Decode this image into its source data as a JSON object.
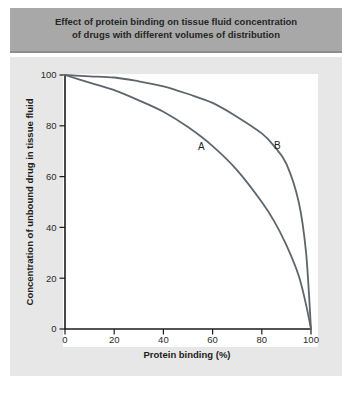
{
  "figure": {
    "title_lines": [
      "Effect of protein binding on tissue fluid concentration",
      "of drugs with different volumes of distribution"
    ]
  },
  "colors": {
    "title_bar_bg": "#a8a8a8",
    "title_bar_edge": "#8d8d8d",
    "title_text": "#262626",
    "panel_bg": "#e7e7e7",
    "plot_bg": "#ffffff",
    "axis": "#1c1c1c",
    "tick_text": "#2a2a2a",
    "curve": "#5d656d"
  },
  "chart_data": {
    "type": "line",
    "title": "Effect of protein binding on tissue fluid concentration of drugs with different volumes of distribution",
    "xlabel": "Protein binding (%)",
    "ylabel": "Concentration of unbound drug in tissue fluid",
    "xlim": [
      0,
      100
    ],
    "ylim": [
      0,
      100
    ],
    "x_ticks": [
      0,
      20,
      40,
      60,
      80,
      100
    ],
    "y_ticks": [
      0,
      20,
      40,
      60,
      80,
      100
    ],
    "grid": false,
    "series": [
      {
        "label": "A",
        "points": [
          [
            0,
            100
          ],
          [
            10,
            97
          ],
          [
            20,
            94
          ],
          [
            30,
            90
          ],
          [
            40,
            85.5
          ],
          [
            50,
            79.5
          ],
          [
            60,
            72
          ],
          [
            70,
            62.5
          ],
          [
            80,
            50
          ],
          [
            85,
            42.5
          ],
          [
            90,
            33
          ],
          [
            95,
            21
          ],
          [
            98,
            9.5
          ],
          [
            100,
            0
          ]
        ]
      },
      {
        "label": "B",
        "points": [
          [
            0,
            100
          ],
          [
            10,
            99.5
          ],
          [
            20,
            99
          ],
          [
            30,
            97.5
          ],
          [
            40,
            95.5
          ],
          [
            50,
            92.5
          ],
          [
            60,
            89
          ],
          [
            70,
            83.5
          ],
          [
            80,
            77
          ],
          [
            85,
            72
          ],
          [
            90,
            65
          ],
          [
            95,
            50
          ],
          [
            98,
            30
          ],
          [
            100,
            0
          ]
        ]
      }
    ]
  }
}
